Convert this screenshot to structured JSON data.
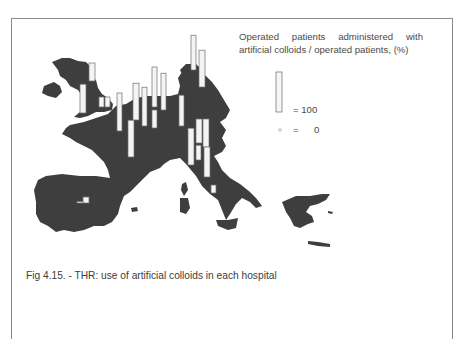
{
  "legend": {
    "title_line1": "Operated patients administered with",
    "title_line2": "artificial colloids / operated patients, (%)",
    "full_label": "= 100",
    "zero_eq": "=",
    "zero_value": "0"
  },
  "caption": "Fig 4.15. - THR: use of artificial colloids in each hospital",
  "chart_data": {
    "type": "bar",
    "title": "Operated patients administered with artificial colloids / operated patients, (%)",
    "caption": "Fig 4.15. - THR: use of artificial colloids in each hospital",
    "ylabel": "%",
    "ylim": [
      0,
      100
    ],
    "legend_scale": {
      "full_bar": 100,
      "dot": 0
    },
    "series": [
      {
        "name": "hospital",
        "region": "UK-north",
        "value": 45
      },
      {
        "name": "hospital",
        "region": "UK-west",
        "value": 72
      },
      {
        "name": "hospital",
        "region": "UK-south-1",
        "value": 25
      },
      {
        "name": "hospital",
        "region": "UK-south-2",
        "value": 25
      },
      {
        "name": "hospital",
        "region": "Belgium",
        "value": 95
      },
      {
        "name": "hospital",
        "region": "France-north",
        "value": 92
      },
      {
        "name": "hospital",
        "region": "France-central",
        "value": 92
      },
      {
        "name": "hospital",
        "region": "Germany-west",
        "value": 97
      },
      {
        "name": "hospital",
        "region": "Germany-north-1",
        "value": 100
      },
      {
        "name": "hospital",
        "region": "Germany-north-2",
        "value": 92
      },
      {
        "name": "hospital",
        "region": "Germany-central",
        "value": 45
      },
      {
        "name": "hospital",
        "region": "Germany-east",
        "value": 77
      },
      {
        "name": "hospital",
        "region": "Scandinavia-1",
        "value": 87
      },
      {
        "name": "hospital",
        "region": "Scandinavia-2",
        "value": 92
      },
      {
        "name": "hospital",
        "region": "Italy-north-1",
        "value": 92
      },
      {
        "name": "hospital",
        "region": "Italy-north-2",
        "value": 60
      },
      {
        "name": "hospital",
        "region": "Italy-north-3",
        "value": 70
      },
      {
        "name": "hospital",
        "region": "Italy-north-4",
        "value": 37
      },
      {
        "name": "hospital",
        "region": "Italy-central",
        "value": 75
      },
      {
        "name": "hospital",
        "region": "Italy-south",
        "value": 20
      },
      {
        "name": "hospital",
        "region": "Spain-1",
        "value": 15
      },
      {
        "name": "hospital",
        "region": "Spain-2",
        "value": 3
      }
    ]
  }
}
